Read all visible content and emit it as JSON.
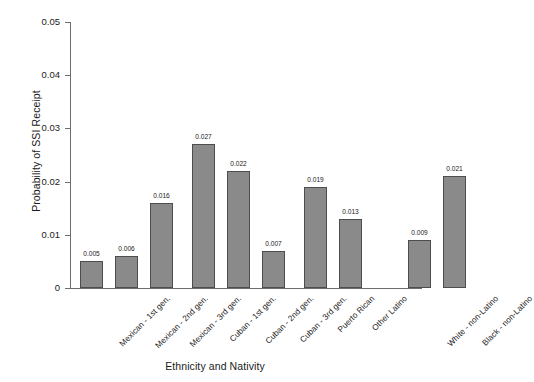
{
  "chart_data": {
    "type": "bar",
    "title": "",
    "xlabel": "Ethnicity and Nativity",
    "ylabel": "Probability of SSI Receipt",
    "ylim": [
      0,
      0.05
    ],
    "ytick_labels": [
      "0.05",
      "0.04",
      "0.03",
      "0.02",
      "0.01",
      "0"
    ],
    "ytick_values": [
      0.05,
      0.04,
      0.03,
      0.02,
      0.01,
      0
    ],
    "grid": false,
    "legend": "none",
    "categories": [
      "Mexican - 1st gen.",
      "Mexican - 2nd gen.",
      "Mexican - 3rd gen.",
      "Cuban - 1st gen.",
      "Cuban - 2nd gen.",
      "Cuban - 3rd gen.",
      "Puerto Rican",
      "Other Latino",
      "White - non-Latino",
      "Black - non-Latino"
    ],
    "values": [
      0.005,
      0.006,
      0.016,
      0.027,
      0.022,
      0.007,
      0.019,
      0.013,
      0.009,
      0.021
    ],
    "value_labels": [
      "0.005",
      "0.006",
      "0.016",
      "0.027",
      "0.022",
      "0.007",
      "0.019",
      "0.013",
      "0.009",
      "0.021"
    ],
    "bar_color": "#8a8a8a",
    "bar_edge_color": "#4d4d4d",
    "axis_color": "#6e6e6e",
    "background_color": "#ffffff"
  }
}
